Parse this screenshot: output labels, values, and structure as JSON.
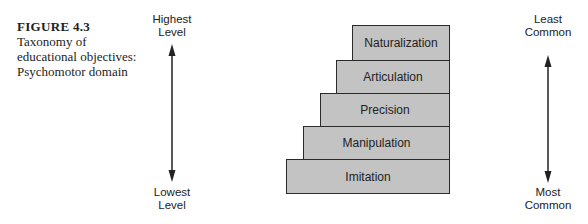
{
  "caption": {
    "figure": "FIGURE 4.3",
    "lines": [
      "Taxonomy of",
      "educational objectives:",
      "Psychomotor domain"
    ]
  },
  "left_axis": {
    "top": [
      "Highest",
      "Level"
    ],
    "bottom": [
      "Lowest",
      "Level"
    ]
  },
  "right_axis": {
    "top": [
      "Least",
      "Common"
    ],
    "bottom": [
      "Most",
      "Common"
    ]
  },
  "levels": [
    {
      "label": "Naturalization",
      "x": 352,
      "y": 25,
      "w": 98,
      "h": 36
    },
    {
      "label": "Articulation",
      "x": 336,
      "y": 60,
      "w": 114,
      "h": 34
    },
    {
      "label": "Precision",
      "x": 320,
      "y": 93,
      "w": 130,
      "h": 34
    },
    {
      "label": "Manipulation",
      "x": 303,
      "y": 126,
      "w": 147,
      "h": 34
    },
    {
      "label": "Imitation",
      "x": 286,
      "y": 159,
      "w": 164,
      "h": 35
    }
  ],
  "colors": {
    "block_fill": "#c3c3c3",
    "stroke": "#2a2a2a",
    "text": "#222222"
  }
}
